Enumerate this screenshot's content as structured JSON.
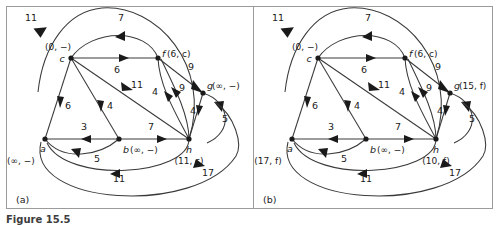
{
  "figure": {
    "caption": "Figure 15.5",
    "panels": [
      {
        "id": "a",
        "label": "(a)",
        "nodes": [
          {
            "key": "a",
            "name": "a",
            "state": "(∞, −)",
            "x": 38,
            "y": 133,
            "name_dx": -2,
            "name_dy": 13,
            "state_dx": -24,
            "state_dy": 25,
            "anchor": "middle"
          },
          {
            "key": "b",
            "name": "b",
            "state": "(∞, −)",
            "x": 112,
            "y": 133,
            "name_dx": 4,
            "name_dy": 14,
            "state_dx": 11,
            "state_dy": 14,
            "anchor": "start"
          },
          {
            "key": "c",
            "name": "c",
            "state": "(0, −)",
            "x": 64,
            "y": 52,
            "name_dx": -9,
            "name_dy": 4,
            "state_dx": -13,
            "state_dy": -8,
            "anchor": "middle"
          },
          {
            "key": "f",
            "name": "f",
            "state": "(6, c)",
            "x": 151,
            "y": 52,
            "name_dx": 4,
            "name_dy": -1,
            "state_dx": 9,
            "state_dy": -1,
            "anchor": "start"
          },
          {
            "key": "g",
            "name": "g",
            "state": "(∞, −)",
            "x": 196,
            "y": 87,
            "name_dx": 4,
            "name_dy": -4,
            "state_dx": 9,
            "state_dy": -4,
            "anchor": "start"
          },
          {
            "key": "h",
            "name": "h",
            "state": "(11, c)",
            "x": 182,
            "y": 133,
            "name_dx": 0,
            "name_dy": 14,
            "state_dx": 0,
            "state_dy": 25,
            "anchor": "middle"
          }
        ],
        "weights": [
          {
            "value": "11",
            "x": 24,
            "y": 15
          },
          {
            "value": "7",
            "x": 114,
            "y": 15
          },
          {
            "value": "6",
            "x": 110,
            "y": 67
          },
          {
            "value": "9",
            "x": 184,
            "y": 64
          },
          {
            "value": "11",
            "x": 130,
            "y": 82
          },
          {
            "value": "4",
            "x": 148,
            "y": 89
          },
          {
            "value": "9",
            "x": 175,
            "y": 85
          },
          {
            "value": "6",
            "x": 61,
            "y": 103
          },
          {
            "value": "4",
            "x": 103,
            "y": 103
          },
          {
            "value": "4",
            "x": 186,
            "y": 108
          },
          {
            "value": "5",
            "x": 218,
            "y": 116
          },
          {
            "value": "3",
            "x": 77,
            "y": 124
          },
          {
            "value": "7",
            "x": 144,
            "y": 124
          },
          {
            "value": "5",
            "x": 90,
            "y": 156
          },
          {
            "value": "11",
            "x": 112,
            "y": 176
          },
          {
            "value": "17",
            "x": 201,
            "y": 170
          }
        ]
      },
      {
        "id": "b",
        "label": "(b)",
        "nodes": [
          {
            "key": "a",
            "name": "a",
            "state": "(17, f)",
            "x": 38,
            "y": 133,
            "name_dx": -2,
            "name_dy": 13,
            "state_dx": -24,
            "state_dy": 25,
            "anchor": "middle"
          },
          {
            "key": "b",
            "name": "b",
            "state": "(∞, −)",
            "x": 112,
            "y": 133,
            "name_dx": 4,
            "name_dy": 14,
            "state_dx": 11,
            "state_dy": 14,
            "anchor": "start"
          },
          {
            "key": "c",
            "name": "c",
            "state": "(0, −)",
            "x": 64,
            "y": 52,
            "name_dx": -9,
            "name_dy": 4,
            "state_dx": -13,
            "state_dy": -8,
            "anchor": "middle"
          },
          {
            "key": "f",
            "name": "f",
            "state": "(6, c)",
            "x": 151,
            "y": 52,
            "name_dx": 4,
            "name_dy": -1,
            "state_dx": 9,
            "state_dy": -1,
            "anchor": "start"
          },
          {
            "key": "g",
            "name": "g",
            "state": "(15, f)",
            "x": 196,
            "y": 87,
            "name_dx": 4,
            "name_dy": -4,
            "state_dx": 9,
            "state_dy": -4,
            "anchor": "start"
          },
          {
            "key": "h",
            "name": "h",
            "state": "(10, f)",
            "x": 182,
            "y": 133,
            "name_dx": 0,
            "name_dy": 14,
            "state_dx": 0,
            "state_dy": 25,
            "anchor": "middle"
          }
        ],
        "weights": [
          {
            "value": "11",
            "x": 24,
            "y": 15
          },
          {
            "value": "7",
            "x": 114,
            "y": 15
          },
          {
            "value": "6",
            "x": 110,
            "y": 67
          },
          {
            "value": "9",
            "x": 184,
            "y": 64
          },
          {
            "value": "11",
            "x": 130,
            "y": 82
          },
          {
            "value": "4",
            "x": 148,
            "y": 89
          },
          {
            "value": "9",
            "x": 175,
            "y": 85
          },
          {
            "value": "6",
            "x": 61,
            "y": 103
          },
          {
            "value": "4",
            "x": 103,
            "y": 103
          },
          {
            "value": "4",
            "x": 186,
            "y": 108
          },
          {
            "value": "5",
            "x": 218,
            "y": 116
          },
          {
            "value": "3",
            "x": 77,
            "y": 124
          },
          {
            "value": "7",
            "x": 144,
            "y": 124
          },
          {
            "value": "5",
            "x": 90,
            "y": 156
          },
          {
            "value": "11",
            "x": 112,
            "y": 176
          },
          {
            "value": "17",
            "x": 201,
            "y": 170
          }
        ]
      }
    ]
  },
  "graph_data": {
    "type": "directed-weighted-graph",
    "vertices": [
      "a",
      "b",
      "c",
      "f",
      "g",
      "h"
    ],
    "edges": [
      {
        "from": "h",
        "to": "a",
        "weight": 11,
        "shape": "arc-top-left"
      },
      {
        "from": "f",
        "to": "c",
        "weight": 7,
        "shape": "arc-top"
      },
      {
        "from": "c",
        "to": "f",
        "weight": 6,
        "shape": "straight"
      },
      {
        "from": "f",
        "to": "g",
        "weight": 9,
        "shape": "straight"
      },
      {
        "from": "c",
        "to": "h",
        "weight": 11,
        "shape": "straight"
      },
      {
        "from": "h",
        "to": "f",
        "weight": 4,
        "shape": "curve"
      },
      {
        "from": "h",
        "to": "f",
        "weight": 9,
        "shape": "curve"
      },
      {
        "from": "a",
        "to": "c",
        "weight": 6,
        "shape": "straight"
      },
      {
        "from": "c",
        "to": "b",
        "weight": 4,
        "shape": "straight"
      },
      {
        "from": "h",
        "to": "g",
        "weight": 4,
        "shape": "straight"
      },
      {
        "from": "g",
        "to": "h",
        "weight": 5,
        "shape": "arc-right"
      },
      {
        "from": "b",
        "to": "a",
        "weight": 3,
        "shape": "straight"
      },
      {
        "from": "b",
        "to": "h",
        "weight": 7,
        "shape": "straight"
      },
      {
        "from": "a",
        "to": "b",
        "weight": 5,
        "shape": "arc-bottom"
      },
      {
        "from": "h",
        "to": "a",
        "weight": 11,
        "shape": "arc-bottom"
      },
      {
        "from": "a",
        "to": "h",
        "weight": 17,
        "shape": "arc-bottom-wide"
      }
    ]
  }
}
